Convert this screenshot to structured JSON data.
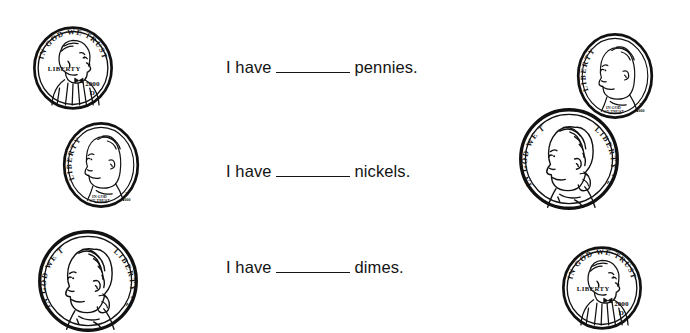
{
  "page": {
    "background_color": "#ffffff",
    "ink_color": "#141414",
    "width": 690,
    "height": 328
  },
  "sentences": [
    {
      "id": "pennies",
      "lead": "I have",
      "blank": "_______",
      "noun": "pennies.",
      "full_text": "I have _______ pennies."
    },
    {
      "id": "nickels",
      "lead": "I have",
      "blank": "_______",
      "noun": "nickels.",
      "full_text": "I have _______ nickels."
    },
    {
      "id": "dimes",
      "lead": "I have",
      "blank": "_______",
      "noun": "dimes.",
      "full_text": "I have _______ dimes."
    }
  ],
  "coins": [
    {
      "id": "penny-top-left",
      "denomination": "penny",
      "value_cents": 1,
      "portrait": "Lincoln",
      "facing": "right",
      "motto": "IN GOD WE TRUST",
      "liberty": "LIBERTY",
      "year": "2000",
      "mint_mark": "D",
      "width": 84,
      "height": 88,
      "x": 31,
      "y": 24
    },
    {
      "id": "dime-mid-left",
      "denomination": "dime",
      "value_cents": 10,
      "portrait": "Roosevelt",
      "facing": "left",
      "motto": "IN GOD WE TRUST",
      "liberty": "LIBERTY",
      "year": "2000",
      "mint_mark": "P",
      "width": 80,
      "height": 90,
      "x": 61,
      "y": 120
    },
    {
      "id": "nickel-bot-left",
      "denomination": "nickel",
      "value_cents": 5,
      "portrait": "Jefferson",
      "facing": "left",
      "motto": "IN GOD WE TRUST",
      "liberty": "LIBERTY",
      "year": "2000",
      "mint_mark": "",
      "width": 104,
      "height": 104,
      "x": 36,
      "y": 229
    },
    {
      "id": "dime-top-right",
      "denomination": "dime",
      "value_cents": 10,
      "portrait": "Roosevelt",
      "facing": "left",
      "motto": "IN GOD WE TRUST",
      "liberty": "LIBERTY",
      "year": "2000",
      "mint_mark": "P",
      "width": 80,
      "height": 90,
      "x": 575,
      "y": 31
    },
    {
      "id": "nickel-mid-right",
      "denomination": "nickel",
      "value_cents": 5,
      "portrait": "Jefferson",
      "facing": "left",
      "motto": "IN GOD WE TRUST",
      "liberty": "LIBERTY",
      "year": "2000",
      "mint_mark": "",
      "width": 104,
      "height": 104,
      "x": 517,
      "y": 107
    },
    {
      "id": "penny-bot-right",
      "denomination": "penny",
      "value_cents": 1,
      "portrait": "Lincoln",
      "facing": "right",
      "motto": "IN GOD WE TRUST",
      "liberty": "LIBERTY",
      "year": "2000",
      "mint_mark": "D",
      "width": 84,
      "height": 88,
      "x": 560,
      "y": 244
    }
  ],
  "counts": {
    "pennies_shown": 2,
    "nickels_shown": 2,
    "dimes_shown": 2
  }
}
